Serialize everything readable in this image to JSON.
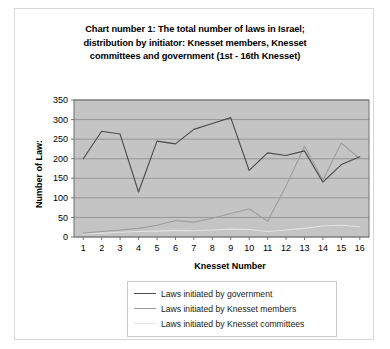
{
  "chart_data": {
    "type": "line",
    "title": "Chart number 1: The total number of laws in Israel; distribution by initiator: Knesset members, Knesset committees and government (1st - 16th Knesset)",
    "title_lines": [
      "Chart number 1: The total number of laws in Israel;",
      "distribution by initiator: Knesset members, Knesset",
      "committees and government (1st - 16th Knesset)"
    ],
    "xlabel": "Knesset Number",
    "ylabel": "Number of Law:",
    "categories": [
      "1",
      "2",
      "3",
      "4",
      "5",
      "6",
      "7",
      "8",
      "9",
      "10",
      "11",
      "12",
      "13",
      "14",
      "15",
      "16"
    ],
    "yticks": [
      "0",
      "50",
      "100",
      "150",
      "200",
      "250",
      "300",
      "350"
    ],
    "ylim": [
      0,
      350
    ],
    "grid": true,
    "legend_position": "bottom",
    "plot_background": "#c4c4c4",
    "series": [
      {
        "name": "Laws initiated by government",
        "color": "#4a4a4a",
        "values": [
          200,
          270,
          263,
          115,
          245,
          238,
          275,
          290,
          305,
          170,
          215,
          208,
          220,
          140,
          185,
          205
        ]
      },
      {
        "name": "Laws initiated by Knesset members",
        "color": "#9d9d9d",
        "values": [
          10,
          14,
          18,
          22,
          30,
          42,
          38,
          48,
          60,
          72,
          40,
          130,
          232,
          145,
          240,
          200
        ]
      },
      {
        "name": "Laws initiated by Knesset committees",
        "color": "#e2e2e2",
        "values": [
          8,
          10,
          12,
          14,
          15,
          17,
          16,
          18,
          20,
          19,
          14,
          18,
          22,
          28,
          30,
          26
        ]
      }
    ]
  }
}
